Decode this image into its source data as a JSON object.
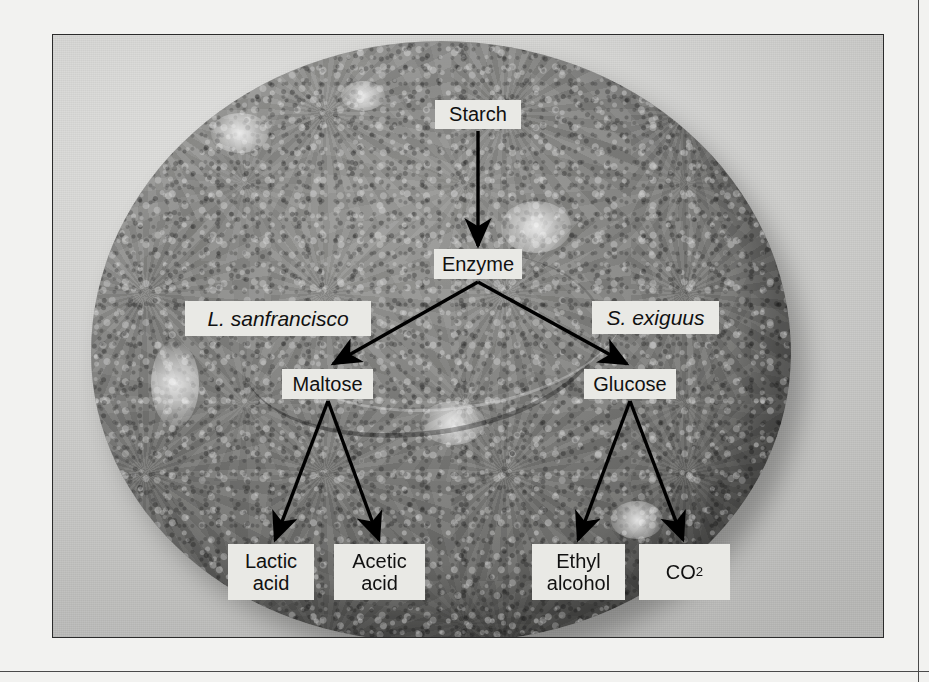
{
  "figure": {
    "type": "flow-diagram-over-photograph",
    "subject_photo": "round sourdough bread loaf, grayscale photograph",
    "background_color": "#f2f2f0",
    "photo_border_color": "#2b2b2b",
    "node_fill_color": "#e9e9e5",
    "arrow_color": "#000000"
  },
  "nodes": [
    {
      "id": "starch",
      "label": "Starch",
      "italic": false,
      "x": 435,
      "y": 100,
      "w": 86,
      "h": 29
    },
    {
      "id": "enzyme",
      "label": "Enzyme",
      "italic": false,
      "x": 434,
      "y": 249,
      "w": 88,
      "h": 30
    },
    {
      "id": "l-sanfrancisco",
      "label": "L. sanfrancisco",
      "italic": true,
      "x": 185,
      "y": 301,
      "w": 186,
      "h": 35
    },
    {
      "id": "s-exiguus",
      "label": "S. exiguus",
      "italic": true,
      "x": 592,
      "y": 301,
      "w": 127,
      "h": 33
    },
    {
      "id": "maltose",
      "label": "Maltose",
      "italic": false,
      "x": 282,
      "y": 369,
      "w": 91,
      "h": 30
    },
    {
      "id": "glucose",
      "label": "Glucose",
      "italic": false,
      "x": 584,
      "y": 369,
      "w": 92,
      "h": 30
    },
    {
      "id": "lactic-acid",
      "label": "Lactic\nacid",
      "italic": false,
      "x": 228,
      "y": 544,
      "w": 86,
      "h": 56
    },
    {
      "id": "acetic-acid",
      "label": "Acetic\nacid",
      "italic": false,
      "x": 334,
      "y": 544,
      "w": 91,
      "h": 56
    },
    {
      "id": "ethyl-alcohol",
      "label": "Ethyl\nalcohol",
      "italic": false,
      "x": 532,
      "y": 544,
      "w": 93,
      "h": 56
    },
    {
      "id": "co2",
      "label": "CO",
      "subscript": "2",
      "italic": false,
      "x": 639,
      "y": 544,
      "w": 91,
      "h": 56
    }
  ],
  "arrows": [
    {
      "id": "starch-to-enzyme",
      "from": "starch",
      "to": "enzyme",
      "x1": 478,
      "y1": 131,
      "x2": 478,
      "y2": 246
    },
    {
      "id": "enzyme-to-maltose",
      "from": "enzyme",
      "to": "maltose",
      "x1": 478,
      "y1": 282,
      "x2": 333,
      "y2": 364
    },
    {
      "id": "enzyme-to-glucose",
      "from": "enzyme",
      "to": "glucose",
      "x1": 478,
      "y1": 282,
      "x2": 627,
      "y2": 364
    },
    {
      "id": "maltose-to-lactic-acid",
      "from": "maltose",
      "to": "lactic-acid",
      "x1": 328,
      "y1": 401,
      "x2": 275,
      "y2": 540
    },
    {
      "id": "maltose-to-acetic-acid",
      "from": "maltose",
      "to": "acetic-acid",
      "x1": 328,
      "y1": 401,
      "x2": 379,
      "y2": 540
    },
    {
      "id": "glucose-to-ethyl-alcohol",
      "from": "glucose",
      "to": "ethyl-alcohol",
      "x1": 630,
      "y1": 401,
      "x2": 578,
      "y2": 540
    },
    {
      "id": "glucose-to-co2",
      "from": "glucose",
      "to": "co2",
      "x1": 630,
      "y1": 401,
      "x2": 683,
      "y2": 540
    }
  ],
  "chart_data": {
    "type": "diagram",
    "title": "",
    "nodes": [
      "Starch",
      "Enzyme",
      "L. sanfrancisco",
      "S. exiguus",
      "Maltose",
      "Glucose",
      "Lactic acid",
      "Acetic acid",
      "Ethyl alcohol",
      "CO2"
    ],
    "edges": [
      [
        "Starch",
        "Enzyme"
      ],
      [
        "Enzyme",
        "Maltose"
      ],
      [
        "Enzyme",
        "Glucose"
      ],
      [
        "Maltose",
        "Lactic acid"
      ],
      [
        "Maltose",
        "Acetic acid"
      ],
      [
        "Glucose",
        "Ethyl alcohol"
      ],
      [
        "Glucose",
        "CO2"
      ]
    ],
    "annotations": [
      {
        "label": "L. sanfrancisco",
        "applies_to_branch": "Enzyme -> Maltose"
      },
      {
        "label": "S. exiguus",
        "applies_to_branch": "Enzyme -> Glucose"
      }
    ]
  }
}
